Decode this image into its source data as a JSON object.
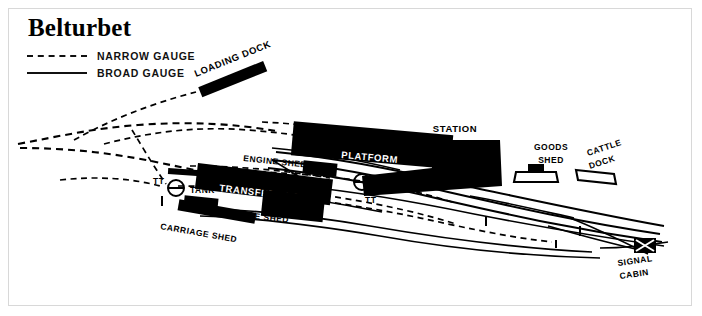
{
  "map": {
    "title": "Belturbet",
    "legend": {
      "items": [
        {
          "label": "NARROW GAUGE",
          "style": "dashed"
        },
        {
          "label": "BROAD GAUGE",
          "style": "solid"
        }
      ]
    },
    "features": {
      "loading_dock": "LOADING DOCK",
      "platform": "PLATFORM",
      "station_building_line1": "STATION",
      "station_building_line2": "BUILDING",
      "goods_shed_line1": "GOODS",
      "goods_shed_line2": "SHED",
      "cattle_dock_line1": "CATTLE",
      "cattle_dock_line2": "DOCK",
      "engine_shed_upper": "ENGINE SHED",
      "engine_shed_lower": "ENGINE SHED",
      "transfer_shed": "TRANSFER SHED",
      "carriage_shed": "CARRIAGE SHED",
      "tank": "TANK",
      "turntable_west": "TT",
      "turntable_east": "TT",
      "signal_cabin_line1": "SIGNAL",
      "signal_cabin_line2": "CABIN"
    },
    "colors": {
      "ink": "#000000",
      "paper": "#ffffff",
      "border": "#d8d8d8"
    }
  }
}
